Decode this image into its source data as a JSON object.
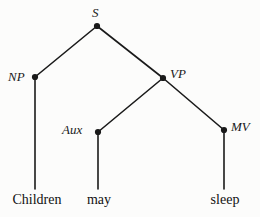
{
  "figure": {
    "type": "syntax-tree",
    "sentence": "Children may sleep",
    "background_color": "#fcfcfb",
    "line_color": "#1a1a1a",
    "text_color": "#111111"
  },
  "nodes": {
    "s": {
      "label": "S",
      "x": 97,
      "y": 26,
      "label_x": 92,
      "label_y": 6,
      "label_side": "above"
    },
    "np": {
      "label": "NP",
      "x": 35,
      "y": 77,
      "label_x": 8,
      "label_y": 70,
      "label_side": "left"
    },
    "vp": {
      "label": "VP",
      "x": 163,
      "y": 78,
      "label_x": 170,
      "label_y": 67,
      "label_side": "right"
    },
    "aux": {
      "label": "Aux",
      "x": 98,
      "y": 132,
      "label_x": 62,
      "label_y": 123,
      "label_side": "left"
    },
    "mv": {
      "label": "MV",
      "x": 224,
      "y": 130,
      "label_x": 231,
      "label_y": 120,
      "label_side": "right"
    }
  },
  "leaves": [
    {
      "word": "Children",
      "x": 37,
      "y": 193,
      "parent": "np",
      "line_from_x": 35,
      "line_from_y": 77,
      "line_to_y": 189
    },
    {
      "word": "may",
      "x": 99,
      "y": 193,
      "parent": "aux",
      "line_from_x": 98,
      "line_from_y": 132,
      "line_to_y": 189
    },
    {
      "word": "sleep",
      "x": 225,
      "y": 193,
      "parent": "mv",
      "line_from_x": 224,
      "line_from_y": 130,
      "line_to_y": 189
    }
  ],
  "edges": [
    {
      "from": "s",
      "to": "np",
      "x1": 97,
      "y1": 26,
      "x2": 35,
      "y2": 77
    },
    {
      "from": "s",
      "to": "vp",
      "x1": 97,
      "y1": 26,
      "x2": 163,
      "y2": 78
    },
    {
      "from": "vp",
      "to": "aux",
      "x1": 163,
      "y1": 78,
      "x2": 98,
      "y2": 132
    },
    {
      "from": "vp",
      "to": "mv",
      "x1": 163,
      "y1": 78,
      "x2": 224,
      "y2": 130
    }
  ]
}
